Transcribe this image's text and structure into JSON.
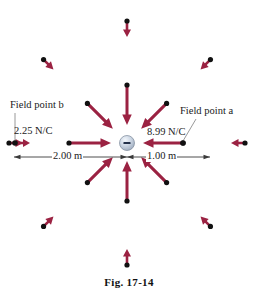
{
  "figure": {
    "caption": "Fig. 17-14",
    "charge": {
      "sign": "−",
      "type": "negative-point-charge",
      "cx": 127,
      "cy": 143,
      "r": 7.5,
      "fill": "#c9d4e2",
      "edge": "#7b8899",
      "sign_color": "#23304a"
    },
    "colors": {
      "arrow": "#9B2242",
      "arrow_dark": "#8a1e3c",
      "dot": "#111111",
      "dimension_line": "#3a3a3a",
      "leader_line": "#8d8d8d",
      "text": "#1a1a1a"
    },
    "labels": {
      "field_point_a": "Field point a",
      "field_point_b": "Field point b",
      "value_a": "8.99 N/C",
      "value_b": "2.25 N/C",
      "distance_b": "2.00 m",
      "distance_a": "1.00 m"
    },
    "inner_vectors": [
      {
        "name": "inner-vector-right-from-a",
        "angle_deg": 0,
        "tail_r": 56,
        "head_r": 16,
        "weight": "heavy"
      },
      {
        "name": "inner-vector-upper-right",
        "angle_deg": 45,
        "tail_r": 56,
        "head_r": 20,
        "weight": "heavy"
      },
      {
        "name": "inner-vector-up",
        "angle_deg": 90,
        "tail_r": 58,
        "head_r": 18,
        "weight": "heavy"
      },
      {
        "name": "inner-vector-upper-left",
        "angle_deg": 135,
        "tail_r": 56,
        "head_r": 20,
        "weight": "heavy"
      },
      {
        "name": "inner-vector-left-from-b",
        "angle_deg": 180,
        "tail_r": 58,
        "head_r": 16,
        "weight": "heavy"
      },
      {
        "name": "inner-vector-lower-left",
        "angle_deg": 225,
        "tail_r": 56,
        "head_r": 20,
        "weight": "heavy"
      },
      {
        "name": "inner-vector-down",
        "angle_deg": 270,
        "tail_r": 58,
        "head_r": 18,
        "weight": "heavy"
      },
      {
        "name": "inner-vector-lower-right",
        "angle_deg": 315,
        "tail_r": 56,
        "head_r": 20,
        "weight": "heavy"
      }
    ],
    "outer_vectors": [
      {
        "name": "outer-vector-right",
        "angle_deg": 0,
        "tail_r": 118,
        "head_r": 104
      },
      {
        "name": "outer-vector-upper-right",
        "angle_deg": 45,
        "tail_r": 118,
        "head_r": 104
      },
      {
        "name": "outer-vector-up",
        "angle_deg": 90,
        "tail_r": 122,
        "head_r": 106
      },
      {
        "name": "outer-vector-upper-left",
        "angle_deg": 135,
        "tail_r": 118,
        "head_r": 104
      },
      {
        "name": "outer-vector-left",
        "angle_deg": 180,
        "tail_r": 118,
        "head_r": 104
      },
      {
        "name": "outer-vector-lower-left",
        "angle_deg": 225,
        "tail_r": 118,
        "head_r": 104
      },
      {
        "name": "outer-vector-down",
        "angle_deg": 270,
        "tail_r": 122,
        "head_r": 106
      },
      {
        "name": "outer-vector-lower-right",
        "angle_deg": 315,
        "tail_r": 118,
        "head_r": 104
      }
    ],
    "dimension": {
      "y": 157,
      "left_x": 14,
      "right_x": 210,
      "center_x": 127
    }
  }
}
